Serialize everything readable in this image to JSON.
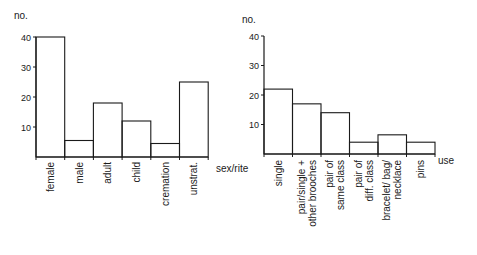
{
  "chart_data": [
    {
      "type": "bar",
      "title": "",
      "xlabel": "sex/rite",
      "ylabel": "no.",
      "ylim": [
        0,
        40
      ],
      "yticks": [
        10,
        20,
        30,
        40
      ],
      "grid": false,
      "categories": [
        "female",
        "male",
        "adult",
        "child",
        "cremation",
        "unstrat."
      ],
      "values": [
        40,
        5.5,
        18,
        12,
        4.5,
        25
      ]
    },
    {
      "type": "bar",
      "title": "",
      "xlabel": "use",
      "ylabel": "no.",
      "ylim": [
        0,
        40
      ],
      "yticks": [
        10,
        20,
        30,
        40
      ],
      "grid": false,
      "categories": [
        "single",
        "pair/single + other brooches",
        "pair of same class",
        "pair of diff. class",
        "bracelet/ bag/ necklace",
        "pins"
      ],
      "category_lines": [
        [
          "single"
        ],
        [
          "pair/single +",
          "other brooches"
        ],
        [
          "pair of",
          "same class"
        ],
        [
          "pair of",
          "diff. class"
        ],
        [
          "bracelet/ bag/",
          "necklace"
        ],
        [
          "pins"
        ]
      ],
      "values": [
        22,
        17,
        14,
        4,
        6.5,
        4
      ]
    }
  ],
  "colors": {
    "ink": "#1a1a1a",
    "background": "#ffffff"
  }
}
